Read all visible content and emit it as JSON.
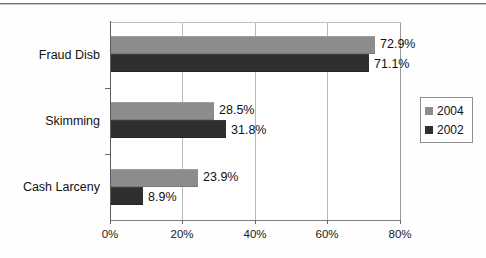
{
  "chart_data": {
    "type": "bar",
    "orientation": "horizontal",
    "title": "",
    "xlabel": "",
    "ylabel": "",
    "categories": [
      "Fraud Disb",
      "Skimming",
      "Cash Larceny"
    ],
    "series": [
      {
        "name": "2004",
        "color": "#8c8c8c",
        "values": [
          72.9,
          28.5,
          23.9
        ],
        "labels": [
          "72.9%",
          "28.5%",
          "23.9%"
        ]
      },
      {
        "name": "2002",
        "color": "#2f2f2f",
        "values": [
          71.1,
          31.8,
          8.9
        ],
        "labels": [
          "71.1%",
          "31.8%",
          "8.9%"
        ]
      }
    ],
    "xlim": [
      0,
      80
    ],
    "xticks": [
      0,
      20,
      40,
      60,
      80
    ],
    "xticklabels": [
      "0%",
      "20%",
      "40%",
      "60%",
      "80%"
    ],
    "grid": "vertical",
    "legend_position": "right"
  },
  "axis": {
    "ticks": [
      {
        "label": "0%",
        "value": 0
      },
      {
        "label": "20%",
        "value": 20
      },
      {
        "label": "40%",
        "value": 40
      },
      {
        "label": "60%",
        "value": 60
      },
      {
        "label": "80%",
        "value": 80
      }
    ]
  },
  "categories": [
    {
      "label": "Fraud Disb"
    },
    {
      "label": "Skimming"
    },
    {
      "label": "Cash Larceny"
    }
  ],
  "bars": [
    {
      "category": "Fraud Disb",
      "series": "2004",
      "value": 72.9,
      "label": "72.9%"
    },
    {
      "category": "Fraud Disb",
      "series": "2002",
      "value": 71.1,
      "label": "71.1%"
    },
    {
      "category": "Skimming",
      "series": "2004",
      "value": 28.5,
      "label": "28.5%"
    },
    {
      "category": "Skimming",
      "series": "2002",
      "value": 31.8,
      "label": "31.8%"
    },
    {
      "category": "Cash Larceny",
      "series": "2004",
      "value": 23.9,
      "label": "23.9%"
    },
    {
      "category": "Cash Larceny",
      "series": "2002",
      "value": 8.9,
      "label": "8.9%"
    }
  ],
  "legend": {
    "entries": [
      {
        "label": "2004",
        "color": "#8c8c8c"
      },
      {
        "label": "2002",
        "color": "#2f2f2f"
      }
    ]
  }
}
